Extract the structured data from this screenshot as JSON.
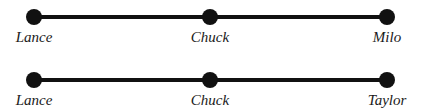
{
  "diagram": {
    "rows": [
      {
        "nodes": [
          {
            "label": "Lance",
            "x": 34
          },
          {
            "label": "Chuck",
            "x": 210
          },
          {
            "label": "Milo",
            "x": 387
          }
        ]
      },
      {
        "nodes": [
          {
            "label": "Lance",
            "x": 34
          },
          {
            "label": "Chuck",
            "x": 210
          },
          {
            "label": "Taylor",
            "x": 387
          }
        ]
      }
    ],
    "colors": {
      "line": "#111111",
      "node": "#111111",
      "text": "#1a1a1a",
      "background": "#ffffff"
    }
  }
}
